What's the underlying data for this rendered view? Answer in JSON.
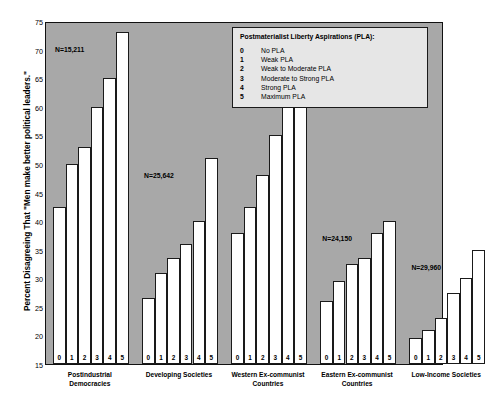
{
  "chart_data": {
    "type": "bar",
    "title": "",
    "xlabel": "",
    "ylabel": "Percent Disagreeing That \"Men make better political leaders.\"",
    "ylim": [
      15,
      75
    ],
    "ytick_step": 5,
    "yticks": [
      75,
      70,
      65,
      60,
      55,
      50,
      45,
      40,
      35,
      30,
      25,
      20,
      15
    ],
    "grid": false,
    "legend_position": "top-right",
    "categories": [
      "0",
      "1",
      "2",
      "3",
      "4",
      "5"
    ],
    "groups": [
      {
        "name": "Postindustrial Democracies",
        "caption_lines": [
          "Postindustrial",
          "Democracies"
        ],
        "n_label": "N=15,211",
        "values": [
          42.5,
          50,
          53,
          60,
          65,
          73
        ]
      },
      {
        "name": "Developing Societies",
        "caption_lines": [
          "Developing Societies"
        ],
        "n_label": "N=25,642",
        "values": [
          26.5,
          31,
          33.5,
          36,
          40,
          51
        ]
      },
      {
        "name": "Western Ex-communist Countries",
        "caption_lines": [
          "Western Ex-communist",
          "Countries"
        ],
        "n_label": "N=6,767",
        "values": [
          38,
          42.5,
          48,
          55,
          60,
          67
        ]
      },
      {
        "name": "Eastern Ex-communist Countries",
        "caption_lines": [
          "Eastern Ex-communist",
          "Countries"
        ],
        "n_label": "N=24,150",
        "values": [
          26,
          29.5,
          32.5,
          33.5,
          38,
          40
        ]
      },
      {
        "name": "Low-Income Societies",
        "caption_lines": [
          "Low-Income Societies"
        ],
        "n_label": "N=29,960",
        "values": [
          19.5,
          21,
          23,
          27.5,
          30,
          35
        ]
      }
    ],
    "legend": {
      "title": "Postmaterialist Liberty Aspirations (PLA):",
      "entries": [
        {
          "key": "0",
          "desc": "No PLA"
        },
        {
          "key": "1",
          "desc": "Weak PLA"
        },
        {
          "key": "2",
          "desc": "Weak to Moderate PLA"
        },
        {
          "key": "3",
          "desc": "Moderate to Strong PLA"
        },
        {
          "key": "4",
          "desc": "Strong PLA"
        },
        {
          "key": "5",
          "desc": "Maximum PLA"
        }
      ]
    },
    "colors": {
      "plot_background": "#a8a8a8",
      "bar_fill": "#ffffff",
      "bar_border": "#1a1a1a",
      "legend_background": "#e6e6e6",
      "text": "#000000"
    }
  }
}
